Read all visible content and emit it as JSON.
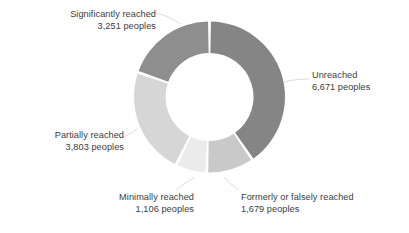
{
  "chart_data": {
    "type": "pie",
    "variant": "donut",
    "title": "",
    "subtitle": "",
    "xlabel": "",
    "ylabel": "",
    "unit": "peoples",
    "total": 16510,
    "legend": "none",
    "grid": false,
    "start_angle_deg": 0,
    "direction": "clockwise",
    "categories": [
      "Unreached",
      "Formerly or falsely reached",
      "Minimally reached",
      "Partially reached",
      "Significantly reached"
    ],
    "values": [
      6671,
      1679,
      1106,
      3803,
      3251
    ],
    "colors": [
      "#858585",
      "#c9c9c9",
      "#ebebeb",
      "#d6d6d6",
      "#8e8e8e"
    ],
    "slices": [
      {
        "name": "Unreached",
        "value": 6671,
        "value_text": "6,671",
        "unit_text": "peoples",
        "color": "#858585",
        "start_deg": 0,
        "end_deg": 145.5,
        "percent": 40.4
      },
      {
        "name": "Formerly or falsely reached",
        "value": 1679,
        "value_text": "1,679",
        "unit_text": "peoples",
        "color": "#c9c9c9",
        "start_deg": 145.5,
        "end_deg": 182.1,
        "percent": 10.2
      },
      {
        "name": "Minimally reached",
        "value": 1106,
        "value_text": "1,106",
        "unit_text": "peoples",
        "color": "#ebebeb",
        "start_deg": 182.1,
        "end_deg": 206.2,
        "percent": 6.7
      },
      {
        "name": "Partially reached",
        "value": 3803,
        "value_text": "3,803",
        "unit_text": "peoples",
        "color": "#d6d6d6",
        "start_deg": 206.2,
        "end_deg": 289.1,
        "percent": 23.0
      },
      {
        "name": "Significantly reached",
        "value": 3251,
        "value_text": "3,251",
        "unit_text": "peoples",
        "color": "#8e8e8e",
        "start_deg": 289.1,
        "end_deg": 360,
        "percent": 19.7
      }
    ]
  },
  "labels": {
    "significantly": {
      "line1": "Significantly reached",
      "line2": "3,251 peoples"
    },
    "unreached": {
      "line1": "Unreached",
      "line2": "6,671 peoples"
    },
    "partially": {
      "line1": "Partially reached",
      "line2": "3,803 peoples"
    },
    "minimally": {
      "line1": "Minimally reached",
      "line2": "1,106 peoples"
    },
    "formerly": {
      "line1": "Formerly or falsely reached",
      "line2": "1,679 peoples"
    }
  },
  "style": {
    "text_color": "#3c3c3c",
    "background": "#ffffff",
    "leader_line_color": "#dcdcdc",
    "slice_gap_color": "#ffffff"
  }
}
